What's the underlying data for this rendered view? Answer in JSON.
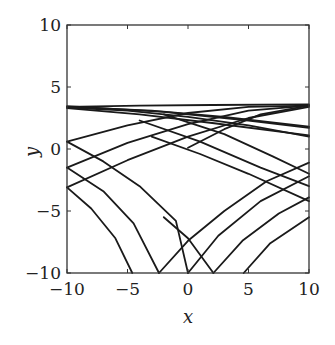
{
  "chart_data": {
    "type": "line",
    "title": "",
    "xlabel": "x",
    "ylabel": "y",
    "xlim": [
      -10,
      10
    ],
    "ylim": [
      -10,
      10
    ],
    "grid": false,
    "legend": null,
    "x_ticks": [
      -10,
      -5,
      0,
      5,
      10
    ],
    "y_ticks": [
      -10,
      -5,
      0,
      5,
      10
    ],
    "x_tick_labels": [
      "−10",
      "−5",
      "0",
      "5",
      "10"
    ],
    "y_tick_labels": [
      "−10",
      "−5",
      "0",
      "5",
      "10"
    ],
    "series": [
      {
        "name": "trajectory-1",
        "points": [
          [
            -10,
            3.4
          ],
          [
            -4,
            3.5
          ],
          [
            2,
            3.55
          ],
          [
            10,
            3.6
          ]
        ]
      },
      {
        "name": "trajectory-2",
        "points": [
          [
            -10,
            3.4
          ],
          [
            -3,
            3.1
          ],
          [
            3,
            2.6
          ],
          [
            10,
            1.8
          ]
        ]
      },
      {
        "name": "trajectory-3",
        "points": [
          [
            -10,
            3.3
          ],
          [
            -4,
            2.8
          ],
          [
            2,
            2.1
          ],
          [
            10,
            1.1
          ]
        ]
      },
      {
        "name": "trajectory-4",
        "points": [
          [
            -10,
            3.45
          ],
          [
            -2,
            3.0
          ],
          [
            5,
            2.3
          ],
          [
            10,
            1.7
          ]
        ]
      },
      {
        "name": "trajectory-5",
        "points": [
          [
            -10,
            3.35
          ],
          [
            -5,
            3.1
          ],
          [
            0,
            2.6
          ],
          [
            5,
            1.9
          ],
          [
            10,
            1.0
          ]
        ]
      },
      {
        "name": "trajectory-6",
        "points": [
          [
            -10,
            0.6
          ],
          [
            -5,
            1.9
          ],
          [
            0,
            2.9
          ],
          [
            5,
            3.4
          ],
          [
            10,
            3.5
          ]
        ]
      },
      {
        "name": "trajectory-7",
        "points": [
          [
            -10,
            -1.5
          ],
          [
            -5,
            0.5
          ],
          [
            0,
            2.0
          ],
          [
            5,
            3.1
          ],
          [
            10,
            3.5
          ]
        ]
      },
      {
        "name": "trajectory-8",
        "points": [
          [
            -10,
            -3.1
          ],
          [
            -5,
            -0.9
          ],
          [
            0,
            1.0
          ],
          [
            5,
            2.5
          ],
          [
            10,
            3.4
          ]
        ]
      },
      {
        "name": "trajectory-9",
        "points": [
          [
            -10,
            0.6
          ],
          [
            -7,
            -1.0
          ],
          [
            -4,
            -3.0
          ],
          [
            -1,
            -5.8
          ],
          [
            0,
            -10
          ]
        ]
      },
      {
        "name": "trajectory-10",
        "points": [
          [
            -10,
            -1.5
          ],
          [
            -7,
            -3.4
          ],
          [
            -4.5,
            -6.0
          ],
          [
            -2.4,
            -10
          ]
        ]
      },
      {
        "name": "trajectory-11",
        "points": [
          [
            -10,
            -3.1
          ],
          [
            -8,
            -4.8
          ],
          [
            -6,
            -7.2
          ],
          [
            -4.6,
            -10
          ]
        ]
      },
      {
        "name": "trajectory-12",
        "points": [
          [
            0,
            0.1
          ],
          [
            3,
            1.6
          ],
          [
            6,
            2.8
          ],
          [
            10,
            3.5
          ]
        ]
      },
      {
        "name": "trajectory-13",
        "points": [
          [
            -2,
            -5.5
          ],
          [
            0,
            -7.2
          ],
          [
            2.1,
            -10
          ]
        ]
      },
      {
        "name": "trajectory-14",
        "points": [
          [
            -2.4,
            -10
          ],
          [
            0,
            -7.4
          ],
          [
            3,
            -5.0
          ],
          [
            6.5,
            -2.6
          ],
          [
            10,
            -1.1
          ]
        ]
      },
      {
        "name": "trajectory-15",
        "points": [
          [
            0,
            -10
          ],
          [
            2.5,
            -7.0
          ],
          [
            6,
            -4.2
          ],
          [
            10,
            -2.2
          ]
        ]
      },
      {
        "name": "trajectory-16",
        "points": [
          [
            2.1,
            -10
          ],
          [
            4.5,
            -7.4
          ],
          [
            7.5,
            -5.2
          ],
          [
            10,
            -3.9
          ]
        ]
      },
      {
        "name": "trajectory-17",
        "points": [
          [
            4.6,
            -10
          ],
          [
            6.8,
            -7.6
          ],
          [
            10,
            -5.5
          ]
        ]
      },
      {
        "name": "trajectory-18",
        "points": [
          [
            -3,
            1.0
          ],
          [
            1,
            -0.4
          ],
          [
            5,
            -2.0
          ],
          [
            10,
            -4.2
          ]
        ]
      },
      {
        "name": "trajectory-19",
        "points": [
          [
            -4,
            2.3
          ],
          [
            1,
            0.6
          ],
          [
            6,
            -1.5
          ],
          [
            10,
            -3.0
          ]
        ]
      },
      {
        "name": "trajectory-20",
        "points": [
          [
            -2,
            2.8
          ],
          [
            3,
            1.2
          ],
          [
            7,
            -0.6
          ],
          [
            10,
            -2.0
          ]
        ]
      }
    ]
  }
}
